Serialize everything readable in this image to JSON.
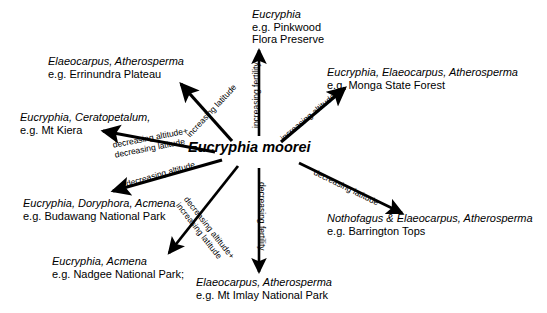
{
  "center": {
    "label": "Eucryphia moorei"
  },
  "nodes": [
    {
      "id": "pinkwood",
      "taxa": "Eucryphia",
      "example": "e.g. Pinkwood",
      "example2": "Flora Preserve"
    },
    {
      "id": "errinundra",
      "taxa": "Elaeocarpus, Atherosperma",
      "example": "e.g. Errinundra Plateau",
      "example2": ""
    },
    {
      "id": "monga",
      "taxa": "Eucryphia, Elaeocarpus, Atherosperma",
      "example": "e.g. Monga State Forest",
      "example2": ""
    },
    {
      "id": "kiera",
      "taxa": "Eucryphia, Ceratopetalum,",
      "example": "e.g. Mt Kiera",
      "example2": ""
    },
    {
      "id": "budawang",
      "taxa": "Eucryphia, Doryphora, Acmena",
      "example": "e.g. Budawang National Park",
      "example2": ""
    },
    {
      "id": "nadgee",
      "taxa": "Eucryphia, Acmena",
      "example": "e.g. Nadgee National Park;",
      "example2": ""
    },
    {
      "id": "imlay",
      "taxa": "Elaeocarpus, Atherosperma",
      "example": "e.g. Mt Imlay National Park",
      "example2": ""
    },
    {
      "id": "barrington",
      "taxa": "Nothofagus & Elaeocarpus, Atherosperma",
      "example": "e.g. Barrington Tops",
      "example2": ""
    }
  ],
  "arrows": [
    {
      "id": "up",
      "label_line1": "increasing fertility",
      "label_line2": ""
    },
    {
      "id": "up-left",
      "label_line1": "increasing latitude",
      "label_line2": ""
    },
    {
      "id": "up-right",
      "label_line1": "increasing altitude",
      "label_line2": ""
    },
    {
      "id": "left",
      "label_line1": "decreasing altitude+",
      "label_line2": "decreasing latitude"
    },
    {
      "id": "down-left-shallow",
      "label_line1": "decreasing altitude",
      "label_line2": ""
    },
    {
      "id": "down-left",
      "label_line1": "decreasing altitude+",
      "label_line2": "increasing latitude"
    },
    {
      "id": "down",
      "label_line1": "decreasing fertility",
      "label_line2": ""
    },
    {
      "id": "down-right",
      "label_line1": "decreasing latitude",
      "label_line2": ""
    }
  ],
  "colors": {
    "background": "#ffffff",
    "ink": "#000000"
  }
}
